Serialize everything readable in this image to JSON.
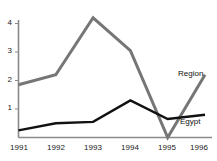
{
  "chart_data": {
    "type": "line",
    "title": "Billions of U.S. dollars",
    "xlabel": "",
    "ylabel": "",
    "x": [
      "1991",
      "1992",
      "1993",
      "1994",
      "1995",
      "1996"
    ],
    "categories": [
      "1991",
      "1992",
      "1993",
      "1994",
      "1995",
      "1996"
    ],
    "y_ticks": [
      "1",
      "2",
      "3",
      "4"
    ],
    "y_tick_values": [
      1,
      2,
      3,
      4
    ],
    "ylim": [
      0,
      4.4
    ],
    "grid": false,
    "legend_position": "inline-right",
    "series": [
      {
        "name": "Region",
        "color": "#767676",
        "values": [
          1.85,
          2.2,
          4.2,
          3.05,
          0.0,
          2.2
        ]
      },
      {
        "name": "Egypt",
        "color": "#111111",
        "values": [
          0.25,
          0.5,
          0.55,
          1.3,
          0.65,
          0.8
        ]
      }
    ]
  },
  "axis": {
    "y_labels": [
      "4",
      "3",
      "2",
      "1"
    ],
    "x_labels": [
      "1991",
      "1992",
      "1993",
      "1994",
      "1995",
      "1996"
    ]
  },
  "labels": {
    "region": "Region",
    "egypt": "Egypt"
  }
}
